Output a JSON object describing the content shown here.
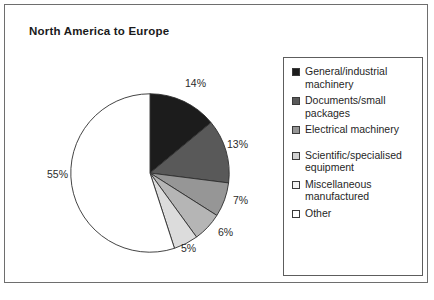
{
  "chart_data": {
    "type": "pie",
    "title": "North America to Europe",
    "categories": [
      "General/industrial machinery",
      "Documents/small packages",
      "Electrical machinery",
      "Scientific/specialised equipment",
      "Miscellaneous manufactured",
      "Other"
    ],
    "values": [
      14,
      13,
      7,
      6,
      5,
      55
    ],
    "value_labels": [
      "14%",
      "13%",
      "7%",
      "6%",
      "5%",
      "55%"
    ],
    "unit": "%",
    "start_angle_deg": 0,
    "direction": "clockwise",
    "legend_position": "right",
    "grid": false,
    "xlabel": "",
    "ylabel": "",
    "slice_colors": [
      "#1c1c1c",
      "#595959",
      "#969696",
      "#b5b5b5",
      "#dcdcdc",
      "#ffffff"
    ],
    "slice_order_note": "Slices drawn clockwise from 12 o'clock",
    "slices": [
      {
        "label": "General/industrial machinery",
        "value": 14,
        "display": "14%",
        "color": "#1c1c1c"
      },
      {
        "label": "Documents/small packages",
        "value": 13,
        "display": "13%",
        "color": "#595959"
      },
      {
        "label": "Electrical machinery",
        "value": 7,
        "display": "7%",
        "color": "#969696"
      },
      {
        "label": "Scientific/specialised equipment",
        "value": 6,
        "display": "6%",
        "color": "#b5b5b5"
      },
      {
        "label": "Miscellaneous manufactured",
        "value": 5,
        "display": "5%",
        "color": "#dcdcdc"
      },
      {
        "label": "Other",
        "value": 55,
        "display": "55%",
        "color": "#ffffff"
      }
    ]
  },
  "title": {
    "text": "North America to Europe"
  },
  "pie_labels": [
    {
      "text": "14%",
      "left": 180,
      "top": 72
    },
    {
      "text": "13%",
      "left": 222,
      "top": 133
    },
    {
      "text": "7%",
      "left": 228,
      "top": 189
    },
    {
      "text": "6%",
      "left": 213,
      "top": 221
    },
    {
      "text": "5%",
      "left": 176,
      "top": 237
    },
    {
      "text": "55%",
      "left": 42,
      "top": 163
    }
  ],
  "legend": {
    "items": [
      {
        "label": "General/industrial machinery",
        "color": "#1c1c1c",
        "gap_after": false
      },
      {
        "label": "Documents/small packages",
        "color": "#595959",
        "gap_after": false
      },
      {
        "label": "Electrical machinery",
        "color": "#969696",
        "gap_after": true
      },
      {
        "label": "Scientific/specialised equipment",
        "color": "#d2d2d2",
        "gap_after": false
      },
      {
        "label": "Miscellaneous manufactured",
        "color": "#f2f2f2",
        "gap_after": false
      },
      {
        "label": "Other",
        "color": "#ffffff",
        "gap_after": false
      }
    ]
  },
  "colors": {
    "frame_border": "#6e6e6e",
    "legend_border": "#5d5d5d",
    "pie_outline": "#2f2f2f",
    "text": "#1f1f1f",
    "background": "#ffffff"
  }
}
